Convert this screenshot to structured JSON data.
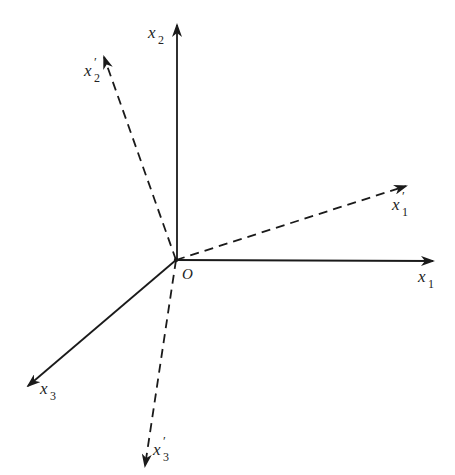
{
  "diagram": {
    "type": "coordinate-axes-rotation",
    "origin": {
      "label": "O",
      "x": 176,
      "y": 260
    },
    "original_axes": [
      {
        "id": "x1",
        "base": "x",
        "subscript": "1",
        "prime": "",
        "style": "solid",
        "tip": [
          433,
          261
        ],
        "label_pos": [
          418,
          287
        ]
      },
      {
        "id": "x2",
        "base": "x",
        "subscript": "2",
        "prime": "",
        "style": "solid",
        "tip": [
          177,
          25
        ],
        "label_pos": [
          150,
          40
        ]
      },
      {
        "id": "x3",
        "base": "x",
        "subscript": "3",
        "prime": "",
        "style": "solid",
        "tip": [
          28,
          386
        ],
        "label_pos": [
          40,
          397
        ]
      }
    ],
    "rotated_axes": [
      {
        "id": "x1p",
        "base": "x",
        "subscript": "1",
        "prime": "′",
        "style": "dashed",
        "tip": [
          406,
          186
        ],
        "label_pos": [
          392,
          216
        ]
      },
      {
        "id": "x2p",
        "base": "x",
        "subscript": "2",
        "prime": "′",
        "style": "dashed",
        "tip": [
          104,
          57
        ],
        "label_pos": [
          84,
          78
        ]
      },
      {
        "id": "x3p",
        "base": "x",
        "subscript": "3",
        "prime": "′",
        "style": "dashed",
        "tip": [
          145,
          466
        ],
        "label_pos": [
          152,
          459
        ]
      }
    ],
    "colors": {
      "stroke": "#1a1a1a",
      "background": "#ffffff"
    }
  },
  "labels": {
    "origin": "O",
    "x1": {
      "base": "x",
      "sub": "1",
      "prime": ""
    },
    "x2": {
      "base": "x",
      "sub": "2",
      "prime": ""
    },
    "x3": {
      "base": "x",
      "sub": "3",
      "prime": ""
    },
    "x1p": {
      "base": "x",
      "sub": "1",
      "prime": "′"
    },
    "x2p": {
      "base": "x",
      "sub": "2",
      "prime": "′"
    },
    "x3p": {
      "base": "x",
      "sub": "3",
      "prime": "′"
    }
  }
}
